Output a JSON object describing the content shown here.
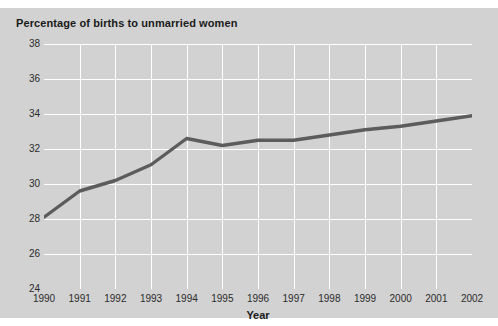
{
  "chart_data": {
    "type": "line",
    "title": "Percentage of births to unmarried women",
    "xlabel": "Year",
    "ylabel": "",
    "x": [
      1990,
      1991,
      1992,
      1993,
      1994,
      1995,
      1996,
      1997,
      1998,
      1999,
      2000,
      2001,
      2002
    ],
    "categories": [
      "1990",
      "1991",
      "1992",
      "1993",
      "1994",
      "1995",
      "1996",
      "1997",
      "1998",
      "1999",
      "2000",
      "2001",
      "2002"
    ],
    "values": [
      28.1,
      29.6,
      30.2,
      31.1,
      32.6,
      32.2,
      32.5,
      32.5,
      32.8,
      33.1,
      33.3,
      33.6,
      33.9
    ],
    "series": [
      {
        "name": "Percentage of births to unmarried women",
        "values": [
          28.1,
          29.6,
          30.2,
          31.1,
          32.6,
          32.2,
          32.5,
          32.5,
          32.8,
          33.1,
          33.3,
          33.6,
          33.9
        ]
      }
    ],
    "ylim": [
      24,
      38
    ],
    "yticks": [
      24,
      26,
      28,
      30,
      32,
      34,
      36,
      38
    ],
    "ytick_labels": [
      "24",
      "26",
      "28",
      "30",
      "32",
      "34",
      "36",
      "38"
    ],
    "xlim": [
      1990,
      2002
    ],
    "xticks": [
      1990,
      1991,
      1992,
      1993,
      1994,
      1995,
      1996,
      1997,
      1998,
      1999,
      2000,
      2001,
      2002
    ],
    "grid": true,
    "legend": "none",
    "line_color": "#5c5c5c",
    "plot_background": "#d2d2d2",
    "gridline_color": "#ffffff",
    "figure_background": "#d2d2d2"
  }
}
